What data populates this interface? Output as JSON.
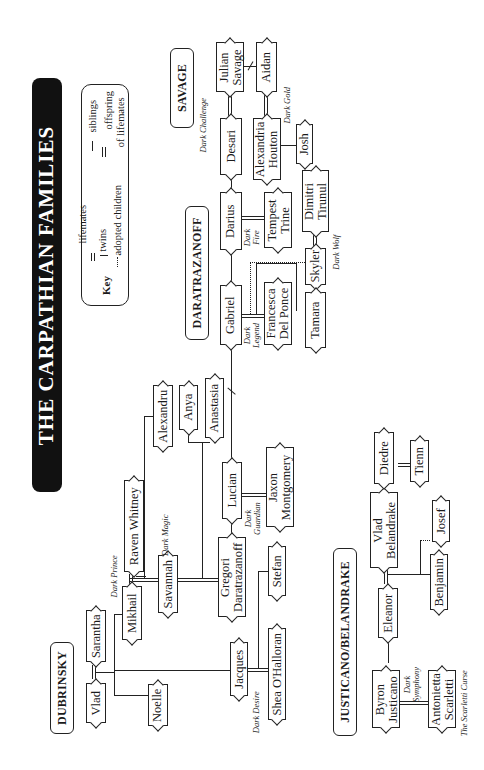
{
  "title": "THE CARPATHIAN FAMILIES",
  "key": {
    "label": "Key",
    "items": [
      {
        "symbol": "double-line",
        "label": "lifemates"
      },
      {
        "symbol": "twins-slash",
        "label": "twins"
      },
      {
        "symbol": "dotted-tee",
        "label": "adopted children"
      },
      {
        "symbol": "single-line",
        "label": "siblings"
      },
      {
        "symbol": "double-tee",
        "label": "offspring"
      },
      {
        "symbol": "",
        "label": "of lifemates"
      }
    ]
  },
  "families": {
    "savage": "SAVAGE",
    "daratrazanoff": "DARATRAZANOFF",
    "dubrinsky": "DUBRINSKY",
    "justicano": "JUSTICANO/BELANDRAKE"
  },
  "people": {
    "julian": [
      "Julian",
      "Savage"
    ],
    "aidan": [
      "Aidan"
    ],
    "desari": [
      "Desari"
    ],
    "alexandria": [
      "Alexandria",
      "Houton"
    ],
    "josh": [
      "Josh"
    ],
    "darius": [
      "Darius"
    ],
    "tempest": [
      "Tempest",
      "Trine"
    ],
    "dimitri": [
      "Dimitri",
      "Tirunul"
    ],
    "gabriel": [
      "Gabriel"
    ],
    "francesca": [
      "Francesca",
      "Del Ponce"
    ],
    "skyler": [
      "Skyler"
    ],
    "tamara": [
      "Tamara"
    ],
    "alexandru": [
      "Alexandru"
    ],
    "anya": [
      "Anya"
    ],
    "anastasia": [
      "Anastasia"
    ],
    "lucian": [
      "Lucian"
    ],
    "jaxon": [
      "Jaxon",
      "Montgomery"
    ],
    "gregori": [
      "Gregori",
      "Daratrazanoff"
    ],
    "raven": [
      "Raven Whitney"
    ],
    "mikhail": [
      "Mikhail"
    ],
    "savannah": [
      "Savannah"
    ],
    "saranta": [
      "Sarantha"
    ],
    "vlad_d": [
      "Vlad"
    ],
    "noelle": [
      "Noelle"
    ],
    "jacques": [
      "Jacques"
    ],
    "stefan": [
      "Stefan"
    ],
    "shea": [
      "Shea O'Halloran"
    ],
    "byron": [
      "Byron",
      "Justicano"
    ],
    "antonietta": [
      "Antonietta",
      "Scarletti"
    ],
    "eleanor": [
      "Eleanor"
    ],
    "vlad_b": [
      "Vlad",
      "Belandrake"
    ],
    "benjamin": [
      "Benjamin"
    ],
    "josef": [
      "Josef"
    ],
    "diedre": [
      "Diedre"
    ],
    "tienn": [
      "Tienn"
    ]
  },
  "books": {
    "dark_challenge": "Dark Challenge",
    "dark_gold": "Dark Gold",
    "dark_fire": [
      "Dark",
      "Fire"
    ],
    "dark_legend": [
      "Dark",
      "Legend"
    ],
    "dark_wolf": "Dark Wolf",
    "dark_guardian": [
      "Dark",
      "Guardian"
    ],
    "dark_magic": "Dark Magic",
    "dark_prince": "Dark Prince",
    "dark_desire": "Dark Desire",
    "dark_symphony": [
      "Dark",
      "Symphony"
    ],
    "scarletti_curse": "The Scarletti Curse"
  }
}
